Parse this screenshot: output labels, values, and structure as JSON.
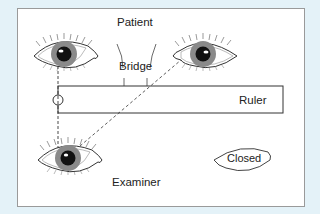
{
  "labels": {
    "patient": "Patient",
    "bridge": "Bridge",
    "ruler": "Ruler",
    "examiner": "Examiner",
    "closed": "Closed"
  },
  "colors": {
    "background": "#e4f2f8",
    "panel": "#ffffff",
    "line": "#333333",
    "iris": "#8a8a8a",
    "pupil": "#111111"
  }
}
